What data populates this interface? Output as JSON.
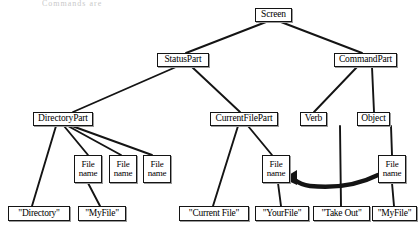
{
  "diagram": {
    "kind": "parse-tree",
    "header_caption": "Commands are",
    "colors": {
      "line": "#141414",
      "node_border": "#141414",
      "node_fill": "#ffffff",
      "text": "#000000",
      "shadow": "#9a9a9a",
      "background": "#ffffff"
    },
    "nodes": {
      "screen": {
        "label": "Screen",
        "x": 255,
        "y": 8,
        "w": 37,
        "h": 14
      },
      "status_part": {
        "label": "StatusPart",
        "x": 157,
        "y": 53,
        "w": 52,
        "h": 14
      },
      "command_part": {
        "label": "CommandPart",
        "x": 334,
        "y": 53,
        "w": 63,
        "h": 14
      },
      "directory_part": {
        "label": "DirectoryPart",
        "x": 33,
        "y": 112,
        "w": 60,
        "h": 14
      },
      "current_file_part": {
        "label": "CurrentFilePart",
        "x": 210,
        "y": 112,
        "w": 68,
        "h": 14
      },
      "verb": {
        "label": "Verb",
        "x": 300,
        "y": 112,
        "w": 27,
        "h": 14
      },
      "object": {
        "label": "Object",
        "x": 357,
        "y": 112,
        "w": 33,
        "h": 14
      },
      "file_name_1": {
        "line1": "File",
        "line2": "name",
        "x": 74,
        "y": 155,
        "w": 28,
        "h": 28
      },
      "file_name_2": {
        "line1": "File",
        "line2": "name",
        "x": 109,
        "y": 155,
        "w": 28,
        "h": 28
      },
      "file_name_3": {
        "line1": "File",
        "line2": "name",
        "x": 143,
        "y": 155,
        "w": 28,
        "h": 28
      },
      "file_name_4": {
        "line1": "File",
        "line2": "name",
        "x": 262,
        "y": 155,
        "w": 28,
        "h": 28
      },
      "file_name_5": {
        "line1": "File",
        "line2": "name",
        "x": 378,
        "y": 155,
        "w": 28,
        "h": 28
      }
    },
    "leaves": {
      "directory": {
        "label": "\"Directory\"",
        "x": 8,
        "y": 206,
        "w": 62,
        "h": 15
      },
      "myfile_left": {
        "label": "\"MyFile\"",
        "x": 78,
        "y": 206,
        "w": 48,
        "h": 15
      },
      "current_file": {
        "label": "\"Current File\"",
        "x": 179,
        "y": 206,
        "w": 70,
        "h": 15
      },
      "yourfile": {
        "label": "\"YourFile\"",
        "x": 255,
        "y": 206,
        "w": 54,
        "h": 15
      },
      "take_out": {
        "label": "\"Take Out\"",
        "x": 313,
        "y": 206,
        "w": 57,
        "h": 15
      },
      "myfile_right": {
        "label": "\"MyFile\"",
        "x": 372,
        "y": 206,
        "w": 45,
        "h": 15
      }
    },
    "edges": [
      {
        "name": "screen-to-statuspart",
        "from": "screen",
        "to": "status_part"
      },
      {
        "name": "screen-to-commandpart",
        "from": "screen",
        "to": "command_part"
      },
      {
        "name": "statuspart-to-directorypart",
        "from": "status_part",
        "to": "directory_part"
      },
      {
        "name": "statuspart-to-currentfilepart",
        "from": "status_part",
        "to": "current_file_part"
      },
      {
        "name": "commandpart-to-verb",
        "from": "command_part",
        "to": "verb"
      },
      {
        "name": "commandpart-to-object",
        "from": "command_part",
        "to": "object"
      },
      {
        "name": "directorypart-to-directory",
        "from": "directory_part",
        "to": "directory"
      },
      {
        "name": "directorypart-to-filename1",
        "from": "directory_part",
        "to": "file_name_1"
      },
      {
        "name": "directorypart-to-filename2",
        "from": "directory_part",
        "to": "file_name_2"
      },
      {
        "name": "directorypart-to-filename3",
        "from": "directory_part",
        "to": "file_name_3"
      },
      {
        "name": "filename1-to-myfile",
        "from": "file_name_1",
        "to": "myfile_left"
      },
      {
        "name": "currentfilepart-to-currentfile",
        "from": "current_file_part",
        "to": "current_file"
      },
      {
        "name": "currentfilepart-to-filename4",
        "from": "current_file_part",
        "to": "file_name_4"
      },
      {
        "name": "filename4-to-yourfile",
        "from": "file_name_4",
        "to": "yourfile"
      },
      {
        "name": "verb-to-takeout",
        "from": "verb",
        "to": "take_out"
      },
      {
        "name": "object-to-filename5",
        "from": "object",
        "to": "file_name_5"
      },
      {
        "name": "filename5-to-myfile",
        "from": "file_name_5",
        "to": "myfile_right"
      }
    ],
    "link_arrow": {
      "name": "filename5-to-filename4-link-arrow",
      "description": "thick curved arrow from right File name node to left File name node",
      "from": "file_name_5",
      "to": "file_name_4",
      "direction": "right-to-left"
    }
  }
}
